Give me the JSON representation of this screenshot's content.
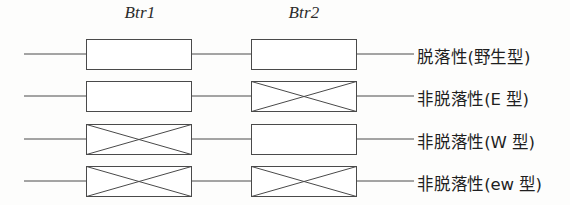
{
  "diagram": {
    "background_color": "#fdfdfc",
    "line_color": "#4a4a4a",
    "box_fill_color": "#ffffff",
    "headers": [
      {
        "id": "btr1",
        "label": "Btr1",
        "center_x": 140
      },
      {
        "id": "btr2",
        "label": "Btr2",
        "center_x": 304
      }
    ],
    "geometry": {
      "line_start_x": 24,
      "line_end_x": 414,
      "box1_x": 86,
      "box2_x": 251,
      "box_width": 105,
      "box_height": 30,
      "row_centers_y": [
        54,
        96,
        139,
        181
      ]
    },
    "rows": [
      {
        "id": "row-wild-type",
        "label": "脱落性(野生型)",
        "btr1_state": "intact",
        "btr2_state": "intact"
      },
      {
        "id": "row-e-type",
        "label": "非脱落性(E 型)",
        "btr1_state": "intact",
        "btr2_state": "crossed"
      },
      {
        "id": "row-w-type",
        "label": "非脱落性(W 型)",
        "btr1_state": "crossed",
        "btr2_state": "intact"
      },
      {
        "id": "row-ew-type",
        "label": "非脱落性(ew 型)",
        "btr1_state": "crossed",
        "btr2_state": "crossed"
      }
    ]
  }
}
